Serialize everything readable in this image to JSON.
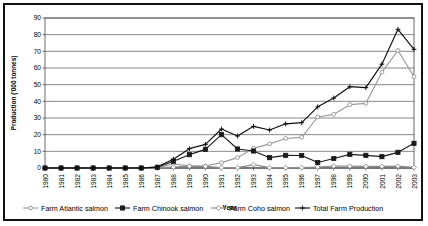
{
  "chart_data": {
    "type": "line",
    "title": "",
    "xlabel": "Year",
    "ylabel": "Production ('000 tonnes)",
    "ylim": [
      0,
      90
    ],
    "ytick_step": 10,
    "yticks": [
      0,
      10,
      20,
      30,
      40,
      50,
      60,
      70,
      80,
      90
    ],
    "grid": true,
    "legend_position": "bottom",
    "categories": [
      "1980",
      "1981",
      "1982",
      "1983",
      "1984",
      "1985",
      "1986",
      "1987",
      "1988",
      "1989",
      "1990",
      "1991",
      "1992",
      "1993",
      "1994",
      "1995",
      "1996",
      "1997",
      "1998",
      "1999",
      "2000",
      "2001",
      "2002",
      "2003"
    ],
    "x": [
      "1980",
      "1981",
      "1982",
      "1983",
      "1984",
      "1985",
      "1986",
      "1987",
      "1988",
      "1989",
      "1990",
      "1991",
      "1992",
      "1993",
      "1994",
      "1995",
      "1996",
      "1997",
      "1998",
      "1999",
      "2000",
      "2001",
      "2002",
      "2003"
    ],
    "series": [
      {
        "name": "Farm Atlantic salmon",
        "marker": "circle",
        "color": "#9a9a9a",
        "values": [
          0,
          0,
          0,
          0,
          0,
          0,
          0,
          0.2,
          2.5,
          1.2,
          1.2,
          3.2,
          6.2,
          11.8,
          14.5,
          17.7,
          18.4,
          30.6,
          32.2,
          38.0,
          38.8,
          57.5,
          70.5,
          54.8
        ]
      },
      {
        "name": "Farm Chinook salmon",
        "marker": "square",
        "color": "#1a1a1a",
        "values": [
          0,
          0,
          0,
          0,
          0,
          0,
          0,
          0.4,
          4.0,
          8.0,
          11.2,
          20.0,
          11.4,
          10.2,
          6.2,
          7.6,
          7.5,
          3.3,
          5.7,
          8.2,
          7.6,
          6.8,
          9.4,
          14.8
        ]
      },
      {
        "name": "Farm Coho salmon",
        "marker": "diamond",
        "color": "#8d8d8d",
        "values": [
          0,
          0,
          0,
          0,
          0,
          0,
          0,
          0.1,
          0.6,
          1.1,
          1.0,
          0.2,
          0.2,
          2.0,
          0.2,
          0.2,
          0.2,
          0.6,
          1.2,
          1.1,
          1.0,
          1.0,
          1.1,
          0.4
        ]
      },
      {
        "name": "Total Farm Production",
        "marker": "plus",
        "color": "#111111",
        "values": [
          0,
          0,
          0,
          0,
          0,
          0,
          0,
          0.7,
          5.3,
          11.6,
          14.2,
          23.4,
          19.2,
          25.0,
          22.8,
          26.5,
          27.2,
          36.7,
          42.0,
          48.8,
          48.2,
          62.3,
          83.2,
          71.2
        ]
      }
    ]
  }
}
